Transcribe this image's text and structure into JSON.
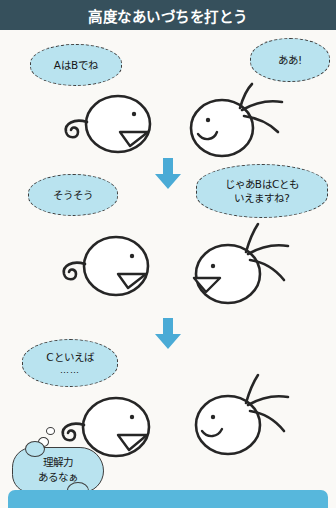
{
  "header": {
    "title": "高度なあいづちを打とう",
    "bg_color": "#36505c",
    "text_color": "#ffffff"
  },
  "theme": {
    "page_bg": "#faf9f6",
    "bubble_fill": "#b9e3ef",
    "ink": "#262626",
    "accent_blue": "#4aabd6",
    "bottom_bar": "#57b7dc"
  },
  "panels": [
    {
      "index": 1,
      "left_character": {
        "name": "curly-haired-person",
        "facing": "right",
        "expression": "open-mouth-smile",
        "hair": "spiral-curl"
      },
      "left_bubble": {
        "kind": "speech",
        "lines": [
          "AはBでね"
        ]
      },
      "right_character": {
        "name": "spiky-haired-person",
        "facing": "left",
        "expression": "smile",
        "hair": "three-spikes"
      },
      "right_bubble": {
        "kind": "speech",
        "lines": [
          "ああ!"
        ]
      }
    },
    {
      "index": 2,
      "left_character": {
        "name": "curly-haired-person",
        "facing": "right",
        "expression": "open-mouth-smile",
        "hair": "spiral-curl"
      },
      "left_bubble": {
        "kind": "speech",
        "lines": [
          "そうそう"
        ]
      },
      "right_character": {
        "name": "spiky-haired-person",
        "facing": "left",
        "expression": "open-mouth-smile",
        "hair": "three-spikes"
      },
      "right_bubble": {
        "kind": "speech",
        "lines": [
          "じゃあBはCとも",
          "いえますね?"
        ]
      }
    },
    {
      "index": 3,
      "left_character": {
        "name": "curly-haired-person",
        "facing": "right",
        "expression": "open-mouth-smile",
        "hair": "spiral-curl"
      },
      "left_bubble": {
        "kind": "speech",
        "lines": [
          "Cといえば",
          "……"
        ]
      },
      "thought_bubble": {
        "kind": "thought",
        "lines": [
          "理解力",
          "あるなぁ"
        ]
      },
      "right_character": {
        "name": "spiky-haired-person",
        "facing": "left",
        "expression": "smile",
        "hair": "three-spikes"
      }
    }
  ],
  "arrows": [
    {
      "name": "down-arrow-1",
      "direction": "down",
      "color": "#4aabd6"
    },
    {
      "name": "down-arrow-2",
      "direction": "down",
      "color": "#4aabd6"
    }
  ],
  "footer": {
    "bar_color": "#57b7dc",
    "label": ""
  }
}
